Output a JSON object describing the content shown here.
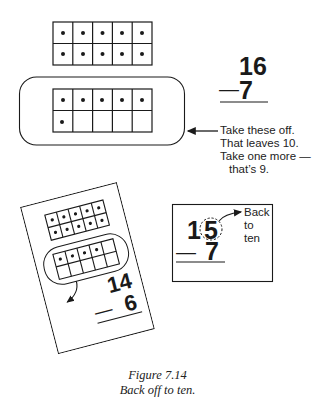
{
  "figure": {
    "caption_number": "Figure 7.14",
    "caption_title": "Back off to ten."
  },
  "top_panel": {
    "full_ten_frame": {
      "rows": 2,
      "cols": 5,
      "filled": 10
    },
    "circled_ten_frame": {
      "rows": 2,
      "cols": 5,
      "filled": 6
    },
    "problem": {
      "top": "16",
      "operator": "—",
      "bottom": "7"
    },
    "annotation_lines": [
      "Take these off.",
      "That leaves 10.",
      "Take one more —",
      "that’s 9."
    ]
  },
  "tilted_card": {
    "full_ten_frame": {
      "rows": 2,
      "cols": 5,
      "filled": 10
    },
    "circled_ten_frame": {
      "rows": 2,
      "cols": 5,
      "filled": 4
    },
    "problem": {
      "top": "14",
      "operator": "—",
      "bottom": "6"
    }
  },
  "back_to_ten_card": {
    "problem": {
      "tens_digit": "1",
      "ones_digit": "5",
      "operator": "—",
      "bottom": "7"
    },
    "annotation_lines": [
      "Back",
      "to",
      "ten"
    ]
  },
  "colors": {
    "ink": "#1a1a1a",
    "background": "#ffffff"
  }
}
